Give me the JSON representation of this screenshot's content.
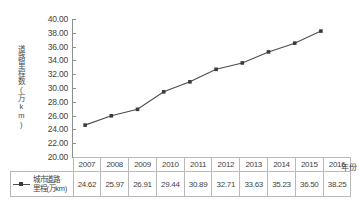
{
  "chart_data": {
    "type": "line",
    "title": "",
    "xlabel": "年份",
    "ylabel": "道路里程数(万km)",
    "categories": [
      "2007",
      "2008",
      "2009",
      "2010",
      "2011",
      "2012",
      "2013",
      "2014",
      "2015",
      "2016"
    ],
    "series": [
      {
        "name": "城市道路里程(万km)",
        "values": [
          24.62,
          25.97,
          26.91,
          29.44,
          30.89,
          32.71,
          33.63,
          35.23,
          36.5,
          38.25
        ]
      }
    ],
    "ylim": [
      20.0,
      40.0
    ],
    "ytick_step": 2.0,
    "ytick_labels": [
      "40.00",
      "38.00",
      "36.00",
      "34.00",
      "32.00",
      "30.00",
      "28.00",
      "26.00",
      "24.00",
      "22.00",
      "20.00"
    ],
    "grid": false,
    "legend_position": "bottom-left",
    "marker": "square",
    "line_color": "#4d4d4d",
    "marker_color": "#3b3b3b",
    "axis_color": "#8e8e8e"
  },
  "legend": {
    "label_line1": "城市道路",
    "label_line2": "里程(万km)",
    "symbol": "line-with-square-marker"
  },
  "table": {
    "header_values": [
      "2007",
      "2008",
      "2009",
      "2010",
      "2011",
      "2012",
      "2013",
      "2014",
      "2015",
      "2016"
    ],
    "data_values": [
      "24.62",
      "25.97",
      "26.91",
      "29.44",
      "30.89",
      "32.71",
      "33.63",
      "35.23",
      "36.50",
      "38.25"
    ]
  },
  "axis": {
    "x_outer_label": "年份",
    "y_title": "道路里程数(万km)"
  }
}
